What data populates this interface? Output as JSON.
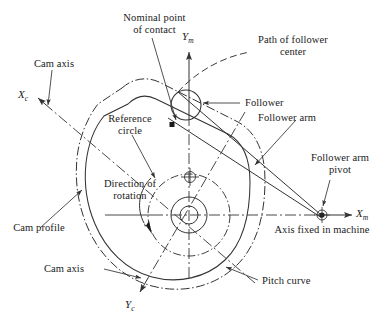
{
  "figure": {
    "line_color": "#333333",
    "text_color": "#1a1a1a",
    "background": "#ffffff"
  },
  "labels": {
    "nominal_point_of_contact": "Nominal point\nof contact",
    "cam_axis_top": "Cam axis",
    "reference_circle": "Reference\ncircle",
    "direction_of_rotation": "Direction of\nrotation",
    "cam_profile": "Cam profile",
    "cam_axis_bottom": "Cam axis",
    "path_of_follower_center": "Path of follower\ncenter",
    "follower": "Follower",
    "follower_arm": "Follower arm",
    "follower_arm_pivot": "Follower arm\npivot",
    "axis_fixed_in_machine": "Axis fixed in machine",
    "pitch_curve": "Pitch curve"
  },
  "axes": {
    "x_machine": {
      "symbol": "X",
      "subscript": "m"
    },
    "y_machine": {
      "symbol": "Y",
      "subscript": "m"
    },
    "x_cam": {
      "symbol": "X",
      "subscript": "c"
    },
    "y_cam": {
      "symbol": "Y",
      "subscript": "c"
    }
  },
  "geometry": {
    "cam_center": {
      "x": 189,
      "y": 215
    },
    "follower_center": {
      "x": 186,
      "y": 105
    },
    "follower_radius": 15,
    "pivot": {
      "x": 322,
      "y": 215
    },
    "contact_point": {
      "x": 172,
      "y": 125
    },
    "reference_circle_radius": 41,
    "hub_outer_radius": 18,
    "hub_inner_radius": 9
  }
}
